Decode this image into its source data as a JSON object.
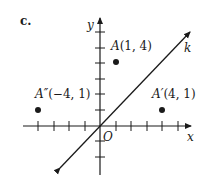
{
  "figure": {
    "part_label": "c.",
    "axes": {
      "x_label": "x",
      "y_label": "y",
      "origin_label": "O",
      "x_ticks": [
        -4,
        -3,
        -2,
        -1,
        1,
        2,
        3,
        4,
        5
      ],
      "y_ticks": [
        -2,
        -1,
        1,
        2,
        3,
        4,
        5
      ]
    },
    "line": {
      "label": "k",
      "equation": "y = x"
    },
    "points": [
      {
        "name": "A",
        "coords": "(1, 4)",
        "x": 1,
        "y": 4
      },
      {
        "name": "A′",
        "coords": "(4, 1)",
        "x": 4,
        "y": 1
      },
      {
        "name": "A″",
        "coords": "(−4, 1)",
        "x": -4,
        "y": 1
      }
    ],
    "colors": {
      "ink": "#1a1a1a",
      "background": "#ffffff"
    }
  }
}
